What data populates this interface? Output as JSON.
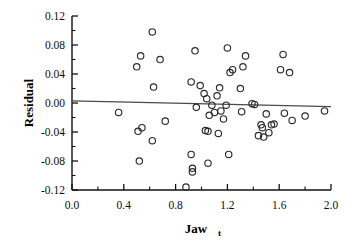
{
  "chart_data": {
    "type": "scatter",
    "title": "",
    "xlabel": "Jaw",
    "xlabel_subscript": "t",
    "ylabel": "Residual",
    "xlim": [
      0.0,
      2.0
    ],
    "ylim": [
      -0.12,
      0.12
    ],
    "xticks": [
      "0.0",
      "0.4",
      "0.8",
      "1.2",
      "1.6",
      "2.0"
    ],
    "xtick_values": [
      0.0,
      0.4,
      0.8,
      1.2,
      1.6,
      2.0
    ],
    "xtick_minor_values": [
      0.2,
      0.6,
      1.0,
      1.4,
      1.8
    ],
    "yticks": [
      "0.12",
      "0.08",
      "0.04",
      "0.00",
      "-0.04",
      "-0.08",
      "-0.12"
    ],
    "ytick_values": [
      0.12,
      0.08,
      0.04,
      0.0,
      -0.04,
      -0.08,
      -0.12
    ],
    "ytick_minor_values": [
      0.1,
      0.06,
      0.02,
      -0.02,
      -0.06,
      -0.1
    ],
    "grid": false,
    "legend": null,
    "marker": "open-circle",
    "marker_color": "#2b2b2b",
    "reference_line": {
      "label": "regression-line",
      "color": "#4a4a4a",
      "x_start": 0.0,
      "y_start": 0.003,
      "x_end": 2.0,
      "y_end": -0.005
    },
    "points": [
      [
        0.36,
        -0.013
      ],
      [
        0.5,
        0.05
      ],
      [
        0.51,
        -0.039
      ],
      [
        0.52,
        -0.08
      ],
      [
        0.53,
        0.065
      ],
      [
        0.54,
        -0.034
      ],
      [
        0.62,
        0.098
      ],
      [
        0.62,
        -0.052
      ],
      [
        0.63,
        0.022
      ],
      [
        0.68,
        0.06
      ],
      [
        0.72,
        -0.025
      ],
      [
        0.88,
        -0.116
      ],
      [
        0.92,
        0.029
      ],
      [
        0.92,
        -0.071
      ],
      [
        0.93,
        -0.09
      ],
      [
        0.93,
        -0.095
      ],
      [
        0.95,
        0.072
      ],
      [
        0.96,
        -0.006
      ],
      [
        0.99,
        0.024
      ],
      [
        1.02,
        0.013
      ],
      [
        1.03,
        -0.038
      ],
      [
        1.04,
        0.006
      ],
      [
        1.05,
        -0.039
      ],
      [
        1.05,
        -0.083
      ],
      [
        1.06,
        -0.017
      ],
      [
        1.08,
        -0.003
      ],
      [
        1.1,
        -0.013
      ],
      [
        1.12,
        0.01
      ],
      [
        1.13,
        -0.042
      ],
      [
        1.14,
        0.021
      ],
      [
        1.15,
        -0.011
      ],
      [
        1.17,
        -0.022
      ],
      [
        1.19,
        -0.003
      ],
      [
        1.2,
        0.076
      ],
      [
        1.21,
        -0.071
      ],
      [
        1.22,
        0.042
      ],
      [
        1.24,
        0.046
      ],
      [
        1.3,
        0.02
      ],
      [
        1.31,
        -0.012
      ],
      [
        1.32,
        0.05
      ],
      [
        1.34,
        0.065
      ],
      [
        1.39,
        -0.001
      ],
      [
        1.41,
        -0.002
      ],
      [
        1.44,
        -0.045
      ],
      [
        1.46,
        -0.03
      ],
      [
        1.47,
        -0.034
      ],
      [
        1.48,
        -0.047
      ],
      [
        1.5,
        -0.015
      ],
      [
        1.52,
        -0.041
      ],
      [
        1.54,
        -0.03
      ],
      [
        1.56,
        -0.029
      ],
      [
        1.61,
        0.046
      ],
      [
        1.63,
        0.067
      ],
      [
        1.64,
        -0.014
      ],
      [
        1.68,
        0.042
      ],
      [
        1.7,
        -0.024
      ],
      [
        1.8,
        -0.018
      ],
      [
        1.95,
        -0.011
      ]
    ]
  }
}
